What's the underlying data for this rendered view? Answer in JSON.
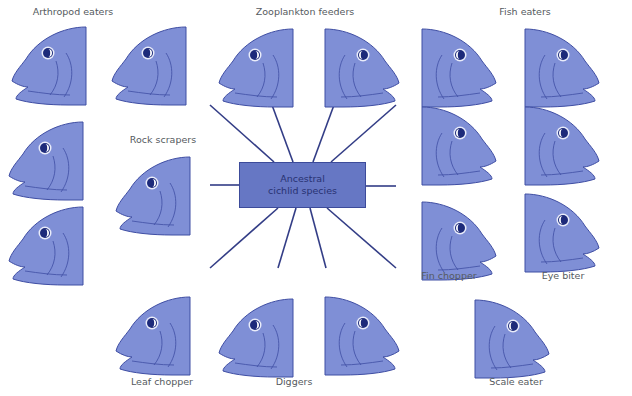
{
  "colors": {
    "fish_fill": "#7f8fd6",
    "fish_stroke": "#3f4ea3",
    "eye": "#1d2a7a",
    "line": "#333d86",
    "box_fill": "#6677c4",
    "label_text": "#555a60"
  },
  "center": {
    "line1": "Ancestral",
    "line2": "cichlid species"
  },
  "groups": [
    {
      "label": "Arthropod eaters",
      "x": 73,
      "y": 9
    },
    {
      "label": "Zooplankton feeders",
      "x": 305,
      "y": 9
    },
    {
      "label": "Fish eaters",
      "x": 525,
      "y": 9
    },
    {
      "label": "Rock scrapers",
      "x": 163,
      "y": 136
    },
    {
      "label": "Fin chopper",
      "x": 449,
      "y": 272
    },
    {
      "label": "Eye biter",
      "x": 563,
      "y": 272
    },
    {
      "label": "Leaf chopper",
      "x": 162,
      "y": 378
    },
    {
      "label": "Diggers",
      "x": 294,
      "y": 378
    },
    {
      "label": "Scale eater",
      "x": 516,
      "y": 378
    }
  ],
  "fish": [
    {
      "id": "arthropod-1",
      "x": 8,
      "y": 25,
      "facing": "left"
    },
    {
      "id": "arthropod-2",
      "x": 108,
      "y": 25,
      "facing": "left"
    },
    {
      "id": "arthropod-3",
      "x": 28,
      "y": 120,
      "facing": "left"
    },
    {
      "id": "arthropod-4",
      "x": 8,
      "y": 200,
      "facing": "left"
    },
    {
      "id": "rock-scraper",
      "x": 128,
      "y": 152,
      "facing": "left"
    },
    {
      "id": "zooplankton-1",
      "x": 220,
      "y": 25,
      "facing": "left"
    },
    {
      "id": "zooplankton-2",
      "x": 323,
      "y": 25,
      "facing": "right"
    },
    {
      "id": "fish-eater-1",
      "x": 420,
      "y": 25,
      "facing": "right"
    },
    {
      "id": "fish-eater-2",
      "x": 523,
      "y": 25,
      "facing": "right"
    },
    {
      "id": "fish-eater-3",
      "x": 420,
      "y": 105,
      "facing": "right"
    },
    {
      "id": "fish-eater-4",
      "x": 523,
      "y": 105,
      "facing": "right"
    },
    {
      "id": "fin-chopper",
      "x": 420,
      "y": 198,
      "facing": "right"
    },
    {
      "id": "eye-biter",
      "x": 523,
      "y": 193,
      "facing": "right"
    },
    {
      "id": "leaf-chopper",
      "x": 118,
      "y": 292,
      "facing": "left"
    },
    {
      "id": "digger-1",
      "x": 218,
      "y": 297,
      "facing": "left"
    },
    {
      "id": "digger-2",
      "x": 323,
      "y": 292,
      "facing": "right"
    },
    {
      "id": "scale-eater",
      "x": 473,
      "y": 297,
      "facing": "right"
    }
  ]
}
